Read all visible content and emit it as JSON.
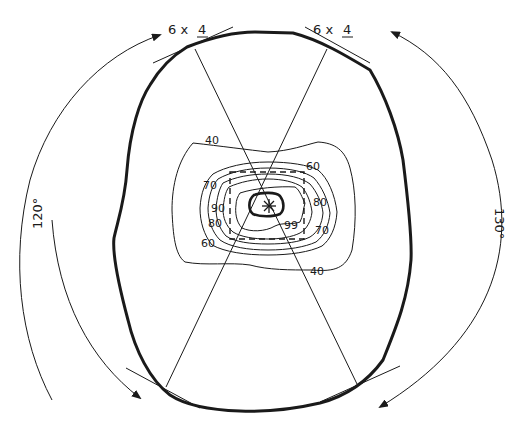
{
  "diagram": {
    "type": "visual field / contour plot",
    "colors": {
      "background": "#ffffff",
      "ink": "#1a1a1a"
    },
    "top_labels": [
      {
        "id": "left",
        "prefix": "6 x ",
        "value": "4"
      },
      {
        "id": "right",
        "prefix": "6 x ",
        "value": "4"
      }
    ],
    "angle_labels": {
      "left": "120°",
      "right": "130°"
    },
    "contour_labels": [
      {
        "text": "40",
        "x": 212,
        "y": 140
      },
      {
        "text": "60",
        "x": 316,
        "y": 167
      },
      {
        "text": "70",
        "x": 209,
        "y": 186
      },
      {
        "text": "80",
        "x": 321,
        "y": 203
      },
      {
        "text": "90",
        "x": 219,
        "y": 209
      },
      {
        "text": "80",
        "x": 212,
        "y": 224
      },
      {
        "text": "99",
        "x": 294,
        "y": 227
      },
      {
        "text": "70",
        "x": 321,
        "y": 233
      },
      {
        "text": "60",
        "x": 207,
        "y": 245
      },
      {
        "text": "40",
        "x": 319,
        "y": 274
      }
    ],
    "contour_levels": [
      "40",
      "60",
      "70",
      "80",
      "90",
      "99"
    ],
    "center_marker": "asterisk"
  }
}
